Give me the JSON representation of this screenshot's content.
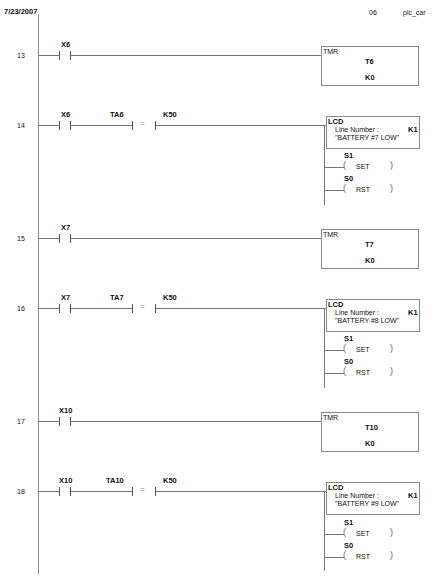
{
  "header": {
    "date": "7/23/2007",
    "page": "06",
    "project": "plc_car"
  },
  "rungs": [
    {
      "number": "13",
      "type": "timer",
      "contact": "X6",
      "box_title": "TMR",
      "timer": "T6",
      "preset": "K0"
    },
    {
      "number": "14",
      "type": "lcd",
      "contact": "X6",
      "compare_left": "TA6",
      "compare_op": "=",
      "compare_right": "K50",
      "box_title": "LCD",
      "line_label": "Line Number :",
      "line_value": "K1",
      "message": "\"BATTERY #7 LOW\"",
      "coil1_addr": "S1",
      "coil1_op": "SET",
      "coil2_addr": "S0",
      "coil2_op": "RST"
    },
    {
      "number": "15",
      "type": "timer",
      "contact": "X7",
      "box_title": "TMR",
      "timer": "T7",
      "preset": "K0"
    },
    {
      "number": "16",
      "type": "lcd",
      "contact": "X7",
      "compare_left": "TA7",
      "compare_op": "=",
      "compare_right": "K50",
      "box_title": "LCD",
      "line_label": "Line Number :",
      "line_value": "K1",
      "message": "\"BATTERY #8 LOW\"",
      "coil1_addr": "S1",
      "coil1_op": "SET",
      "coil2_addr": "S0",
      "coil2_op": "RST"
    },
    {
      "number": "17",
      "type": "timer",
      "contact": "X10",
      "box_title": "TMR",
      "timer": "T10",
      "preset": "K0"
    },
    {
      "number": "18",
      "type": "lcd",
      "contact": "X10",
      "compare_left": "TA10",
      "compare_op": "=",
      "compare_right": "K50",
      "box_title": "LCD",
      "line_label": "Line Number :",
      "line_value": "K1",
      "message": "\"BATTERY #9 LOW\"",
      "coil1_addr": "S1",
      "coil1_op": "SET",
      "coil2_addr": "S0",
      "coil2_op": "RST"
    }
  ]
}
